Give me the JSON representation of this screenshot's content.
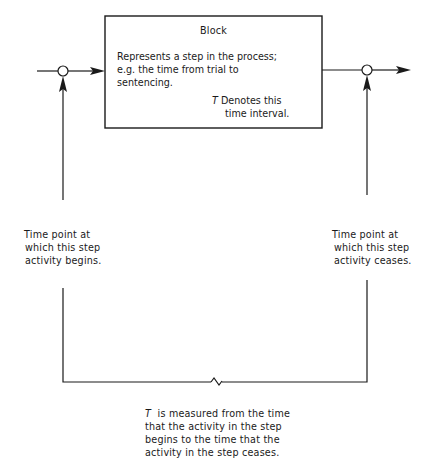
{
  "block": {
    "title": "Block",
    "description_lines": [
      "Represents a step in the process;",
      "e.g. the time from trial to",
      "sentencing."
    ],
    "t_symbol": "T",
    "t_note_lines": [
      "Denotes this",
      "time interval."
    ]
  },
  "left_label": {
    "lines": [
      "Time point at",
      "which this step",
      "activity begins."
    ]
  },
  "right_label": {
    "lines": [
      "Time point at",
      "which this step",
      "activity ceases."
    ]
  },
  "bottom_note": {
    "t_symbol": "T",
    "lines": [
      "is measured from the time",
      "that the activity in the step",
      "begins to the time that the",
      "activity in the step ceases."
    ]
  },
  "colors": {
    "line": "#1a1a1a",
    "background": "#ffffff"
  }
}
